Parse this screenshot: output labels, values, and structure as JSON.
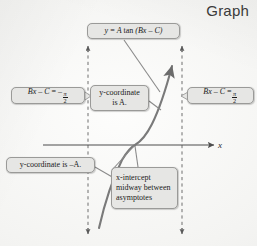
{
  "page": {
    "width": 257,
    "height": 246,
    "background_color": "#f4f4f2",
    "ink_color": "#4a4a4a",
    "callout_fill": "#e6e6e4",
    "callout_border": "#9a9a98"
  },
  "header": {
    "title": "Graph"
  },
  "figure": {
    "type": "math-diagram",
    "axis": {
      "x_label": "x",
      "x_axis_y": 145,
      "x_axis_start": 43,
      "x_axis_end": 219
    },
    "asymptotes": [
      {
        "name": "left-asymptote",
        "x": 88,
        "style": "dashed",
        "arrows": "both"
      },
      {
        "name": "right-asymptote",
        "x": 182,
        "style": "dashed",
        "arrows": "both"
      }
    ],
    "curve": {
      "name": "tangent-curve",
      "description": "increasing tangent branch between asymptotes",
      "x_intercept": {
        "x": 135,
        "y": 145
      }
    }
  },
  "callouts": [
    {
      "id": "equation",
      "name": "equation-callout",
      "text": "y = A tan (Bx – C)",
      "parts": {
        "lhs": "y",
        "eq": "=",
        "amp": "A",
        "fn": "tan",
        "arg": "(Bx – C)"
      }
    },
    {
      "id": "left-asymptote-value",
      "name": "left-asymptote-callout",
      "text": "Bx – C = –π/2",
      "parts": {
        "expr": "Bx – C",
        "eq": "=",
        "sign": "–",
        "num": "π",
        "den": "2"
      }
    },
    {
      "id": "right-asymptote-value",
      "name": "right-asymptote-callout",
      "text": "Bx – C = π/2",
      "parts": {
        "expr": "Bx – C",
        "eq": "=",
        "sign": "",
        "num": "π",
        "den": "2"
      }
    },
    {
      "id": "y-coordinate-a",
      "name": "y-coordinate-a-callout",
      "line1": "y-coordinate",
      "line2": "is A."
    },
    {
      "id": "y-coordinate-neg-a",
      "name": "y-coordinate-negative-a-callout",
      "text": "y-coordinate is –A."
    },
    {
      "id": "x-intercept",
      "name": "x-intercept-callout",
      "line1": "x-intercept",
      "line2": "midway between",
      "line3": "asymptotes"
    }
  ]
}
